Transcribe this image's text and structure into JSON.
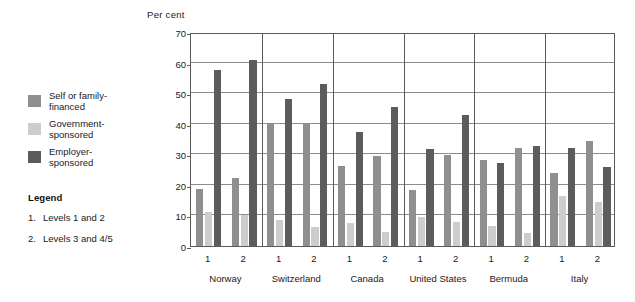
{
  "legend": {
    "series": [
      {
        "id": "self",
        "label": "Self or family-\nfinanced",
        "color": "#8f8f8f"
      },
      {
        "id": "government",
        "label": "Government-\nsponsored",
        "color": "#cdcdcd"
      },
      {
        "id": "employer",
        "label": "Employer-\nsponsored",
        "color": "#5c5c5c"
      }
    ],
    "heading": "Legend",
    "notes": [
      {
        "num": "1.",
        "text": "Levels 1 and 2"
      },
      {
        "num": "2.",
        "text": "Levels 3 and 4/5"
      }
    ]
  },
  "chart_data": {
    "type": "bar",
    "title": "",
    "ylabel": "Per  cent",
    "xlabel": "",
    "ylim": [
      0,
      70
    ],
    "yticks": [
      0,
      10,
      20,
      30,
      40,
      50,
      60,
      70
    ],
    "grid": true,
    "legend_position": "left-outside",
    "groups": [
      "Norway",
      "Switzerland",
      "Canada",
      "United States",
      "Bermuda",
      "Italy"
    ],
    "subcategories": [
      "1",
      "2"
    ],
    "categories": [
      "Norway 1",
      "Norway 2",
      "Switzerland 1",
      "Switzerland 2",
      "Canada 1",
      "Canada 2",
      "United States 1",
      "United States 2",
      "Bermuda 1",
      "Bermuda 2",
      "Italy 1",
      "Italy 2"
    ],
    "series": [
      {
        "name": "Self or family-financed",
        "color": "#8f8f8f",
        "values": [
          18.8,
          22.4,
          40.4,
          40.3,
          26.2,
          29.3,
          18.2,
          29.7,
          28.0,
          31.9,
          23.9,
          34.2
        ]
      },
      {
        "name": "Government-sponsored",
        "color": "#cdcdcd",
        "values": [
          11.0,
          10.1,
          8.6,
          6.1,
          7.5,
          4.5,
          9.4,
          7.7,
          6.4,
          4.2,
          16.2,
          14.5
        ]
      },
      {
        "name": "Employer-sponsored",
        "color": "#5c5c5c",
        "values": [
          57.7,
          60.7,
          48.2,
          53.1,
          37.2,
          45.6,
          31.6,
          42.7,
          27.0,
          32.6,
          31.9,
          25.8
        ]
      }
    ]
  }
}
